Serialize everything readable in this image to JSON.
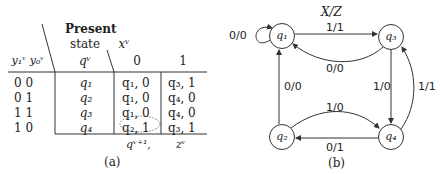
{
  "table": {
    "header": {
      "code_col": "y₁ᵛ y₀ᵛ",
      "present_state_line1": "Present",
      "present_state_line2": "state",
      "present_state_var": "qᵛ",
      "input_var": "xᵛ",
      "input_values": [
        "0",
        "1"
      ]
    },
    "rows": [
      {
        "code": "0 0",
        "state": "q₁",
        "x0": "q₁, 0",
        "x1": "q₃, 1"
      },
      {
        "code": "0 1",
        "state": "q₂",
        "x0": "q₁, 0",
        "x1": "q₄, 0"
      },
      {
        "code": "1 1",
        "state": "q₃",
        "x0": "q₁, 0",
        "x1": "q₄, 0"
      },
      {
        "code": "1 0",
        "state": "q₄",
        "x0": "q₂, 1",
        "x1": "q₃, 1"
      }
    ],
    "highlighted_cell": "q₂, 1",
    "footer_next_state": "qᵛ⁺¹,",
    "footer_output": "zᵛ",
    "caption": "(a)"
  },
  "diagram": {
    "title": "X/Z",
    "caption": "(b)",
    "nodes": [
      {
        "id": "q1",
        "label": "q₁"
      },
      {
        "id": "q3",
        "label": "q₃"
      },
      {
        "id": "q2",
        "label": "q₂"
      },
      {
        "id": "q4",
        "label": "q₄"
      }
    ],
    "edges": [
      {
        "from": "q1",
        "to": "q1",
        "label": "0/0"
      },
      {
        "from": "q1",
        "to": "q3",
        "label": "1/1"
      },
      {
        "from": "q3",
        "to": "q1",
        "label": "0/0"
      },
      {
        "from": "q2",
        "to": "q1",
        "label": "0/0"
      },
      {
        "from": "q3",
        "to": "q4",
        "label": "1/0"
      },
      {
        "from": "q4",
        "to": "q3",
        "label": "1/1"
      },
      {
        "from": "q2",
        "to": "q4",
        "label": "1/0"
      },
      {
        "from": "q4",
        "to": "q2",
        "label": "0/1"
      }
    ]
  }
}
